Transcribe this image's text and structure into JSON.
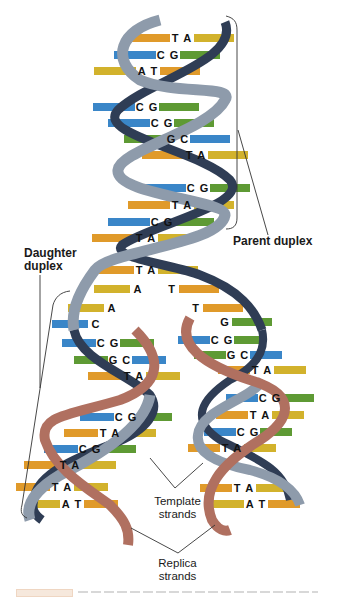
{
  "figure": {
    "labels": {
      "parent_duplex": "Parent duplex",
      "daughter_duplex_line1": "Daughter",
      "daughter_duplex_line2": "duplex",
      "template_strands_line1": "Template",
      "template_strands_line2": "strands",
      "replica_strands_line1": "Replica",
      "replica_strands_line2": "strands"
    },
    "colors": {
      "strand_parent_light": "#8e9bab",
      "strand_parent_dark": "#2f3d55",
      "strand_replica": "#b07060",
      "strand_replica_dark": "#8a4a35",
      "base_A": "#d2b22c",
      "base_T": "#e09a2a",
      "base_C": "#3a86c8",
      "base_G": "#5e9a34",
      "leader_line": "#333333"
    },
    "parent_pairs": [
      {
        "y": 38,
        "x": 182,
        "pair": "T A",
        "left": "#e09a2a",
        "right": "#d2b22c"
      },
      {
        "y": 55,
        "x": 168,
        "pair": "C G",
        "left": "#3a86c8",
        "right": "#5e9a34"
      },
      {
        "y": 71,
        "x": 148,
        "pair": "A T",
        "left": "#d2b22c",
        "right": "#e09a2a"
      },
      {
        "y": 107,
        "x": 147,
        "pair": "C G",
        "left": "#3a86c8",
        "right": "#5e9a34"
      },
      {
        "y": 123,
        "x": 162,
        "pair": "C G",
        "left": "#3a86c8",
        "right": "#5e9a34"
      },
      {
        "y": 139,
        "x": 178,
        "pair": "G C",
        "left": "#5e9a34",
        "right": "#3a86c8"
      },
      {
        "y": 155,
        "x": 196,
        "pair": "T A",
        "left": "#e09a2a",
        "right": "#d2b22c"
      },
      {
        "y": 188,
        "x": 198,
        "pair": "C G",
        "left": "#3a86c8",
        "right": "#5e9a34"
      },
      {
        "y": 205,
        "x": 182,
        "pair": "T A",
        "left": "#e09a2a",
        "right": "#d2b22c"
      },
      {
        "y": 222,
        "x": 162,
        "pair": "C G",
        "left": "#3a86c8",
        "right": "#5e9a34"
      },
      {
        "y": 238,
        "x": 146,
        "pair": "T A",
        "left": "#e09a2a",
        "right": "#d2b22c"
      },
      {
        "y": 270,
        "x": 146,
        "pair": "T A",
        "left": "#e09a2a",
        "right": "#d2b22c"
      }
    ],
    "fork_bases_left": [
      {
        "y": 289,
        "x": 138,
        "base": "A",
        "color": "#d2b22c"
      },
      {
        "y": 308,
        "x": 112,
        "base": "A",
        "color": "#d2b22c"
      },
      {
        "y": 324,
        "x": 96,
        "base": "C",
        "color": "#3a86c8"
      }
    ],
    "fork_bases_right": [
      {
        "y": 289,
        "x": 172,
        "base": "T",
        "color": "#e09a2a"
      },
      {
        "y": 308,
        "x": 196,
        "base": "T",
        "color": "#e09a2a"
      },
      {
        "y": 322,
        "x": 225,
        "base": "G",
        "color": "#5e9a34"
      }
    ],
    "left_daughter_pairs": [
      {
        "y": 343,
        "x": 108,
        "pair": "C G",
        "left": "#3a86c8",
        "right": "#5e9a34"
      },
      {
        "y": 360,
        "x": 120,
        "pair": "G C",
        "left": "#5e9a34",
        "right": "#3a86c8"
      },
      {
        "y": 376,
        "x": 134,
        "pair": "T A",
        "left": "#e09a2a",
        "right": "#d2b22c"
      },
      {
        "y": 417,
        "x": 126,
        "pair": "C G",
        "left": "#3a86c8",
        "right": "#5e9a34"
      },
      {
        "y": 433,
        "x": 110,
        "pair": "T A",
        "left": "#e09a2a",
        "right": "#d2b22c"
      },
      {
        "y": 449,
        "x": 90,
        "pair": "C G",
        "left": "#3a86c8",
        "right": "#5e9a34"
      },
      {
        "y": 465,
        "x": 70,
        "pair": "T A",
        "left": "#e09a2a",
        "right": "#d2b22c"
      },
      {
        "y": 487,
        "x": 62,
        "pair": "T A",
        "left": "#e09a2a",
        "right": "#d2b22c"
      },
      {
        "y": 504,
        "x": 72,
        "pair": "A T",
        "left": "#d2b22c",
        "right": "#e09a2a"
      }
    ],
    "right_daughter_pairs": [
      {
        "y": 340,
        "x": 222,
        "pair": "C G",
        "left": "#3a86c8",
        "right": "#5e9a34"
      },
      {
        "y": 355,
        "x": 238,
        "pair": "G C",
        "left": "#5e9a34",
        "right": "#3a86c8"
      },
      {
        "y": 370,
        "x": 262,
        "pair": "T A",
        "left": "#e09a2a",
        "right": "#d2b22c"
      },
      {
        "y": 398,
        "x": 270,
        "pair": "C G",
        "left": "#3a86c8",
        "right": "#5e9a34"
      },
      {
        "y": 415,
        "x": 260,
        "pair": "T A",
        "left": "#e09a2a",
        "right": "#d2b22c"
      },
      {
        "y": 432,
        "x": 248,
        "pair": "C G",
        "left": "#3a86c8",
        "right": "#5e9a34"
      },
      {
        "y": 448,
        "x": 232,
        "pair": "T A",
        "left": "#e09a2a",
        "right": "#d2b22c"
      },
      {
        "y": 488,
        "x": 244,
        "pair": "T A",
        "left": "#e09a2a",
        "right": "#d2b22c"
      },
      {
        "y": 504,
        "x": 256,
        "pair": "A T",
        "left": "#d2b22c",
        "right": "#e09a2a"
      }
    ]
  }
}
